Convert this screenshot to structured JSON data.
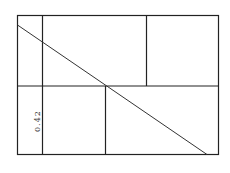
{
  "diagram": {
    "label": "0.42",
    "stroke_color": "#222222",
    "background": "#ffffff"
  }
}
